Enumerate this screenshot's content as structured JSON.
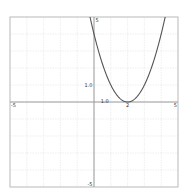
{
  "chart_data": {
    "type": "line",
    "title": "",
    "xlabel": "",
    "ylabel": "",
    "xlim": [
      -5,
      5
    ],
    "ylim": [
      -5,
      5
    ],
    "grid": true,
    "grid_step": 1,
    "series": [
      {
        "name": "y = (x - 2)^2",
        "expression": "(x-2)^2",
        "color": "#555555",
        "x": [
          -0.2,
          0,
          0.5,
          1,
          1.5,
          2,
          2.5,
          3,
          3.5,
          4,
          4.2
        ],
        "y": [
          4.84,
          4,
          2.25,
          1,
          0.25,
          0,
          0.25,
          1,
          2.25,
          4,
          4.84
        ]
      }
    ],
    "tick_labels": {
      "x_min": "-5",
      "x_max": "5",
      "y_max": "5",
      "y_min": "-5",
      "x_unit": "1.0",
      "y_unit": "1.0",
      "vertex_x": "2"
    }
  },
  "colors": {
    "frame": "#bdbdbd",
    "grid": "#e4e4e4",
    "axis": "#9a9a9a",
    "curve": "#555555",
    "background": "#ffffff"
  }
}
